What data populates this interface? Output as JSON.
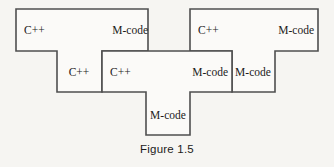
{
  "figure": {
    "caption": "Figure 1.5",
    "type": "t-diagram",
    "colors": {
      "background": "#f6f5f2",
      "shape_fill": "#fbfaf8",
      "stroke": "#4f4f4f",
      "text": "#1b1b1b"
    }
  },
  "shapes": {
    "left_t": {
      "name": "left-t-diagram",
      "source_label": "C++",
      "target_label": "M-code",
      "stem_label": "C++",
      "top_left_x": 16,
      "top_y": 9,
      "top_right_x": 148,
      "top_bottom_y": 51,
      "stem_left_x": 57,
      "stem_right_x": 102,
      "stem_bottom_y": 92
    },
    "middle_t": {
      "name": "middle-t-diagram",
      "source_label": "C++",
      "target_label": "M-code",
      "stem_label": "M-code",
      "left_x": 102,
      "top_y": 51,
      "right_x": 232,
      "bottom_y": 92,
      "stem_left_x": 146,
      "stem_right_x": 190,
      "stem_bottom_y": 135
    },
    "right_t": {
      "name": "right-t-diagram",
      "source_label": "C++",
      "target_label": "M-code",
      "stem_label": "M-code",
      "top_left_x": 190,
      "top_y": 9,
      "top_right_x": 318,
      "top_bottom_y": 51,
      "stem_left_x": 232,
      "stem_right_x": 275,
      "stem_bottom_y": 92
    }
  },
  "labels": [
    {
      "id": "left-top-source",
      "text": "C++",
      "x": 24,
      "y": 34,
      "anchor": "start"
    },
    {
      "id": "left-top-target",
      "text": "M-code",
      "x": 148,
      "y": 34,
      "anchor": "end"
    },
    {
      "id": "left-stem",
      "text": "C++",
      "x": 79,
      "y": 76,
      "anchor": "middle"
    },
    {
      "id": "middle-source",
      "text": "C++",
      "x": 110,
      "y": 76,
      "anchor": "start"
    },
    {
      "id": "middle-target",
      "text": "M-code",
      "x": 228,
      "y": 76,
      "anchor": "end"
    },
    {
      "id": "middle-stem",
      "text": "M-code",
      "x": 168,
      "y": 119,
      "anchor": "middle"
    },
    {
      "id": "right-top-source",
      "text": "C++",
      "x": 198,
      "y": 34,
      "anchor": "start"
    },
    {
      "id": "right-top-target",
      "text": "M-code",
      "x": 314,
      "y": 34,
      "anchor": "end"
    },
    {
      "id": "right-stem",
      "text": "M-code",
      "x": 253,
      "y": 76,
      "anchor": "middle"
    }
  ],
  "paths": {
    "left_t_d": "M 16 9 L 148 9 L 148 51 L 102 51 L 102 92 L 57 92 L 57 51 L 16 51 Z",
    "middle_t_d": "M 102 51 L 232 51 L 232 92 L 190 92 L 190 135 L 146 135 L 146 92 L 102 92 Z",
    "right_t_d": "M 190 9 L 318 9 L 318 51 L 275 51 L 275 92 L 232 92 L 232 51 L 190 51 Z"
  }
}
